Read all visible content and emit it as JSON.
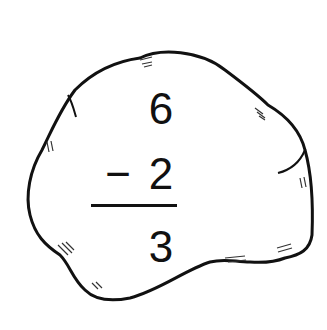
{
  "problem": {
    "operation": "subtraction",
    "minuend": "6",
    "operator": "−",
    "subtrahend": "2",
    "answer": "3"
  },
  "illustration": {
    "shape": "rock",
    "stroke_color": "#111111",
    "fill_color": "#ffffff"
  }
}
